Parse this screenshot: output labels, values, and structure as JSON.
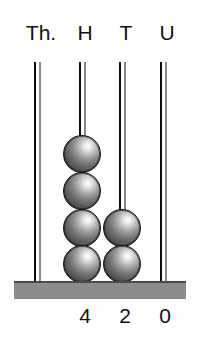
{
  "figure": {
    "name": "place-value-abacus",
    "represented_number": "420",
    "background_color": "#ffffff"
  },
  "colors": {
    "rod_dark": "#0d0d0d",
    "rod_light": "#8a8a8a",
    "base_bar": "#8c8c8c",
    "base_bar_edge": "#4a4a4a",
    "bead_highlight": "#ffffff",
    "bead_shadow": "#3a3a3a",
    "text": "#111111"
  },
  "columns": [
    {
      "label": "Th.",
      "digit": "",
      "bead_count": 0,
      "label_x": 18,
      "label_width": 46,
      "rod_x": 34,
      "bead_x": 18,
      "digit_x": 18,
      "digit_width": 32
    },
    {
      "label": "H",
      "digit": "4",
      "bead_count": 4,
      "label_x": 66,
      "label_width": 38,
      "rod_x": 79,
      "bead_x": 63,
      "digit_x": 69,
      "digit_width": 32
    },
    {
      "label": "T",
      "digit": "2",
      "bead_count": 2,
      "label_x": 107,
      "label_width": 38,
      "rod_x": 119,
      "bead_x": 103,
      "digit_x": 109,
      "digit_width": 32
    },
    {
      "label": "U",
      "digit": "0",
      "bead_count": 0,
      "label_x": 148,
      "label_width": 38,
      "rod_x": 160,
      "bead_x": 144,
      "digit_x": 149,
      "digit_width": 32
    }
  ],
  "bead_geometry": {
    "diameter": 38,
    "stack_bottom_y": 281,
    "vertical_pitch": 37
  }
}
